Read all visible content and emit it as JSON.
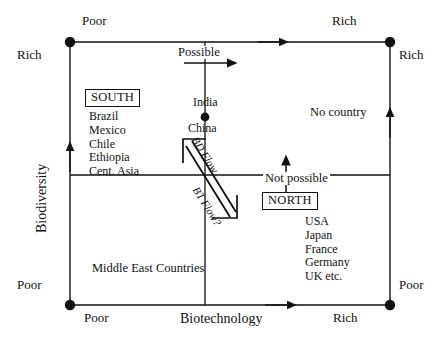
{
  "diagram": {
    "axes": {
      "y_title": "Biodiversity",
      "x_title": "Biotechnology"
    },
    "corner_labels": {
      "top_left_above": "Poor",
      "top_left_side": "Rich",
      "top_right_above": "Rich",
      "top_right_side": "Rich",
      "bottom_left_side": "Poor",
      "bottom_left_below": "Poor",
      "bottom_right_side": "Poor",
      "bottom_right_below": "Rich"
    },
    "regions": {
      "possible": "Possible",
      "not_possible": "Not possible",
      "no_country": "No country",
      "middle_east": "Middle East Countries"
    },
    "points": {
      "india": "India",
      "china": "China"
    },
    "groups": [
      {
        "name": "SOUTH",
        "countries": "Brazil\nMexico\nChile\nEthiopia\nCent. Asia"
      },
      {
        "name": "NORTH",
        "countries": "USA\nJapan\nFrance\nGermany\nUK etc."
      }
    ],
    "flows": {
      "bd_flow": "BD Flow",
      "bt_flow": "BT Flow?"
    },
    "colors": {
      "ink": "#111111",
      "background": "#ffffff"
    }
  }
}
